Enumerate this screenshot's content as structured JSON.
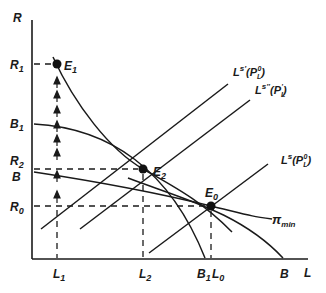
{
  "axes": {
    "y_label": "R",
    "x_label": "L",
    "y_ticks": [
      "R1",
      "B1",
      "R2",
      "B",
      "R0"
    ],
    "x_ticks": [
      "L1",
      "L2",
      "B1",
      "L0",
      "B"
    ]
  },
  "labels": {
    "R": "R",
    "R1": "R",
    "R1_sub": "1",
    "B1_y": "B",
    "B1_y_sub": "1",
    "R2": "R",
    "R2_sub": "2",
    "B_y": "B",
    "R0": "R",
    "R0_sub": "0",
    "L1": "L",
    "L1_sub": "1",
    "L2": "L",
    "L2_sub": "2",
    "B1_x": "B",
    "B1_x_sub": "1",
    "L0": "L",
    "L0_sub": "0",
    "B_x": "B",
    "L": "L",
    "E1": "E",
    "E1_sub": "1",
    "E2": "E",
    "E2_sub": "2",
    "E0": "E",
    "E0_sub": "0",
    "pi_min": "π",
    "pi_min_sub": "min",
    "Ls_prime": "L",
    "Ls_prime_sup": "s'",
    "Ls_prime_arg": "(P",
    "Ls_prime_arg_sub": "L",
    "Ls_prime_arg_sup": "0",
    "Ls_prime_close": ")",
    "Ls_dprime": "L",
    "Ls_dprime_sup": "s''",
    "Ls_dprime_arg": "(P",
    "Ls_dprime_arg_sub": "L",
    "Ls_dprime_arg_sup": "'",
    "Ls_dprime_close": ")",
    "Ls": "L",
    "Ls_sup": "s",
    "Ls_arg": "(P",
    "Ls_arg_sub": "L",
    "Ls_arg_sup": "0",
    "Ls_close": ")"
  },
  "equilibria": [
    {
      "name": "E1",
      "x": 57,
      "y": 64
    },
    {
      "name": "E2",
      "x": 143,
      "y": 169
    },
    {
      "name": "E0",
      "x": 211,
      "y": 206
    }
  ],
  "colors": {
    "ink": "#1a1a1a",
    "background": "#ffffff"
  }
}
